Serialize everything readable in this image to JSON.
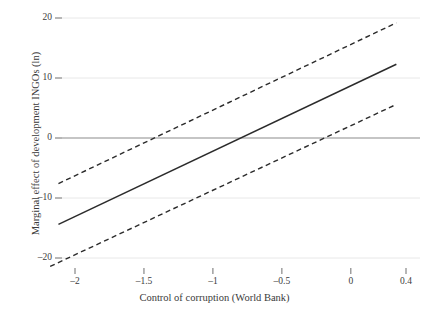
{
  "chart_data": {
    "type": "line",
    "title": "",
    "xlabel": "Control of corruption (World Bank)",
    "ylabel": "Marginal effect of development INGOs (ln)",
    "xlim": [
      -2.18,
      0.4
    ],
    "ylim": [
      -21.6,
      20.8
    ],
    "grid": true,
    "legend": "none",
    "zero_line": true,
    "xticks": [
      -2,
      -1.5,
      -1,
      -0.5,
      0,
      0.4
    ],
    "xtick_labels": [
      "–2",
      "–1.5",
      "–1",
      "–0.5",
      "0",
      "0.4"
    ],
    "yticks": [
      20,
      10,
      0,
      -10,
      -20
    ],
    "ytick_labels": [
      "20",
      "10",
      "0",
      "–10",
      "–20"
    ],
    "series": [
      {
        "name": "Marginal effect",
        "style": "solid",
        "color": "#2b2b2b",
        "x": [
          -2.12,
          0.33
        ],
        "values": [
          -14.4,
          12.3
        ]
      },
      {
        "name": "Upper 95% confidence bound",
        "style": "dashed",
        "color": "#2b2b2b",
        "x": [
          -2.12,
          0.33
        ],
        "values": [
          -7.6,
          19.2
        ]
      },
      {
        "name": "Lower 95% confidence bound",
        "style": "dashed",
        "color": "#2b2b2b",
        "x": [
          -2.18,
          0.33
        ],
        "values": [
          -21.4,
          5.6
        ]
      }
    ],
    "crossings": {
      "marginal_effect_zero_x": -0.82,
      "upper_bound_zero_x": -1.1,
      "lower_bound_zero_x": -0.48
    },
    "colors": {
      "gridline": "#e8e8e8",
      "zero_line": "#8c8c8c",
      "line": "#2b2b2b",
      "tick_mark": "#6f6f6f",
      "background": "#ffffff",
      "text": "#3a3a3a"
    }
  }
}
